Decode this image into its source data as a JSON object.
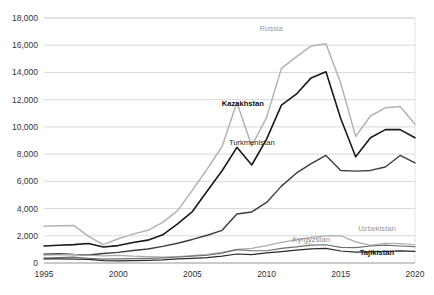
{
  "chart_data": {
    "type": "line",
    "title": "",
    "subtitle": "",
    "xlabel": "",
    "ylabel": "",
    "xlim": [
      1995,
      2020
    ],
    "ylim": [
      0,
      18000
    ],
    "y_ticks": [
      0,
      2000,
      4000,
      6000,
      8000,
      10000,
      12000,
      14000,
      16000,
      18000
    ],
    "y_tick_labels": [
      "0",
      "2,000",
      "4,000",
      "6,000",
      "8,000",
      "10,000",
      "12,000",
      "14,000",
      "16,000",
      "18,000"
    ],
    "x_ticks": [
      1995,
      2000,
      2005,
      2010,
      2015,
      2020
    ],
    "x_tick_labels": [
      "1995",
      "2000",
      "2005",
      "2010",
      "2015",
      "2020"
    ],
    "grid": "horizontal",
    "legend_position": "inline-labels",
    "x": [
      1995,
      1996,
      1997,
      1998,
      1999,
      2000,
      2001,
      2002,
      2003,
      2004,
      2005,
      2006,
      2007,
      2008,
      2009,
      2010,
      2011,
      2012,
      2013,
      2014,
      2015,
      2016,
      2017,
      2018,
      2019,
      2020
    ],
    "series": [
      {
        "name": "Russia",
        "color": "#b3b3b3",
        "width": 1.5,
        "label_x": 2010.3,
        "label_y": 17050,
        "label_color": "#9a9a9a",
        "label_weight": "normal",
        "values": [
          2700,
          2740,
          2760,
          1950,
          1350,
          1780,
          2120,
          2400,
          2980,
          3850,
          5350,
          6920,
          8560,
          11800,
          8600,
          10700,
          14300,
          15150,
          15950,
          16100,
          13200,
          9300,
          10800,
          11400,
          11500,
          10200
        ]
      },
      {
        "name": "Kazakhstan",
        "color": "#1a1a1a",
        "width": 1.6,
        "label_x": 2008.4,
        "label_y": 11500,
        "label_color": "#111111",
        "label_weight": "bold",
        "values": [
          1250,
          1300,
          1350,
          1430,
          1180,
          1280,
          1500,
          1680,
          2070,
          2880,
          3780,
          5290,
          6780,
          8500,
          7200,
          9100,
          11600,
          12400,
          13600,
          14050,
          10600,
          7800,
          9200,
          9800,
          9800,
          9200
        ]
      },
      {
        "name": "Turkmenistan",
        "color": "#3d3d3d",
        "width": 1.4,
        "label_x": 2009.0,
        "label_y": 8650,
        "label_color": "#2a2a2a",
        "label_weight": "normal",
        "values": [
          640,
          680,
          620,
          590,
          700,
          780,
          920,
          1030,
          1220,
          1450,
          1730,
          2040,
          2400,
          3600,
          3750,
          4450,
          5650,
          6600,
          7300,
          7900,
          6800,
          6750,
          6800,
          7050,
          7900,
          7350
        ]
      },
      {
        "name": "Uzbekistan",
        "color": "#ababab",
        "width": 1.2,
        "label_x": 2018.7,
        "label_y": 2350,
        "label_color": "#9a9a9a",
        "label_weight": "normal",
        "values": [
          580,
          600,
          620,
          570,
          520,
          560,
          500,
          470,
          440,
          470,
          540,
          640,
          790,
          1000,
          1080,
          1280,
          1520,
          1700,
          1880,
          2000,
          2000,
          1550,
          1300,
          1450,
          1420,
          1340
        ]
      },
      {
        "name": "Kyrgyzstan",
        "color": "#6e6e6e",
        "width": 1.2,
        "label_x": 2013.0,
        "label_y": 1550,
        "label_color": "#8a8a8a",
        "label_weight": "normal",
        "values": [
          360,
          400,
          430,
          350,
          280,
          300,
          320,
          340,
          380,
          440,
          500,
          570,
          730,
          980,
          900,
          900,
          1080,
          1180,
          1320,
          1340,
          1150,
          1130,
          1250,
          1310,
          1250,
          1200
        ]
      },
      {
        "name": "Tajikistan",
        "color": "#2a2a2a",
        "width": 1.2,
        "label_x": 2018.6,
        "label_y": 620,
        "label_color": "#111111",
        "label_weight": "bold",
        "values": [
          300,
          310,
          290,
          260,
          170,
          160,
          170,
          190,
          230,
          300,
          340,
          400,
          510,
          660,
          620,
          740,
          830,
          940,
          1040,
          1080,
          880,
          800,
          820,
          860,
          890,
          850
        ]
      }
    ]
  }
}
